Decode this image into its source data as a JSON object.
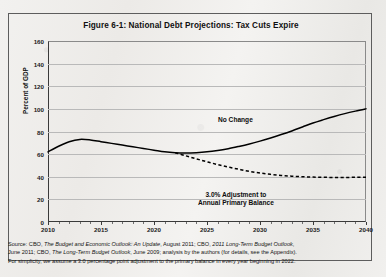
{
  "figure": {
    "title": "Figure 6-1: National Debt Projections: Tax Cuts Expire",
    "ylabel": "Percent of GDP"
  },
  "annotations": {
    "no_change": "No Change",
    "adjustment_line1": "3.0% Adjustment to",
    "adjustment_line2": "Annual Primary Balance"
  },
  "source": {
    "line1_lead": "Source:",
    "line1_a": " CBO, ",
    "line1_b": "The Budget and Economic Outlook: An Update",
    "line1_c": ", August 2011; CBO, ",
    "line1_d": "2011 Long-Term Budget Outlook",
    "line1_e": ",",
    "line2_a": "June 2011; CBO, ",
    "line2_b": "The Long-Term Budget Outlook",
    "line2_c": ", June 2009; analysis by the authors (for details, see the Appendix).",
    "line3": "For simplicity, we assume a 3.0 percentage point adjustment to the primary balance in every year beginning in 2022."
  },
  "chart_data": {
    "type": "line",
    "title": "Figure 6-1: National Debt Projections: Tax Cuts Expire",
    "xlabel": "",
    "ylabel": "Percent of GDP",
    "xlim": [
      2010,
      2040
    ],
    "ylim": [
      0,
      160
    ],
    "yticks": [
      0,
      20,
      40,
      60,
      80,
      100,
      120,
      140,
      160
    ],
    "xticks": [
      2010,
      2015,
      2020,
      2025,
      2030,
      2035,
      2040
    ],
    "grid": "horizontal",
    "legend": "annotations-inline",
    "x": [
      2010,
      2011,
      2012,
      2013,
      2014,
      2015,
      2016,
      2017,
      2018,
      2019,
      2020,
      2021,
      2022,
      2023,
      2024,
      2025,
      2026,
      2027,
      2028,
      2029,
      2030,
      2031,
      2032,
      2033,
      2034,
      2035,
      2036,
      2037,
      2038,
      2039,
      2040
    ],
    "series": [
      {
        "name": "No Change",
        "style": "solid",
        "color": "#000000",
        "values": [
          62,
          67,
          71,
          73,
          72.5,
          71,
          69.5,
          68,
          66.5,
          65,
          63.5,
          62,
          61.2,
          61,
          61.3,
          62,
          63.2,
          64.8,
          66.8,
          69,
          71.5,
          74.3,
          77.3,
          80.5,
          84,
          87.5,
          90.5,
          93.3,
          95.8,
          98,
          100
        ]
      },
      {
        "name": "3.0% Adjustment to Annual Primary Balance",
        "style": "dashed",
        "color": "#000000",
        "values": [
          null,
          null,
          null,
          null,
          null,
          null,
          null,
          null,
          null,
          null,
          null,
          null,
          61.2,
          58.5,
          55.8,
          53.2,
          50.8,
          48.6,
          46.6,
          44.8,
          43.3,
          42.1,
          41.2,
          40.5,
          40,
          39.7,
          39.5,
          39.4,
          39.4,
          39.5,
          39.6
        ]
      }
    ]
  }
}
